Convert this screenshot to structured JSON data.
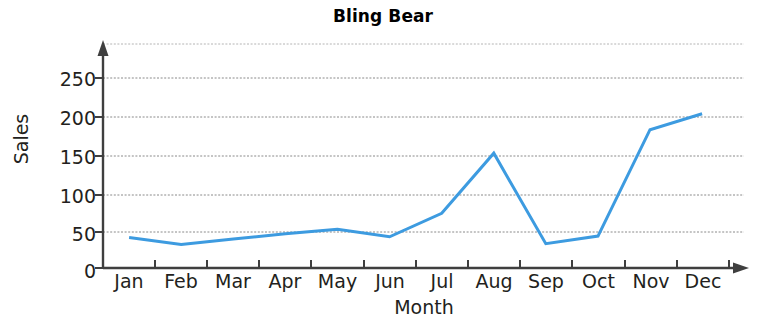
{
  "chart_data": {
    "type": "line",
    "title": "Bling Bear",
    "xlabel": "Month",
    "ylabel": "Sales",
    "categories": [
      "Jan",
      "Feb",
      "Mar",
      "Apr",
      "May",
      "Jun",
      "Jul",
      "Aug",
      "Sep",
      "Oct",
      "Nov",
      "Dec"
    ],
    "values": [
      40,
      31,
      38,
      45,
      51,
      41,
      72,
      151,
      32,
      42,
      182,
      203
    ],
    "series": [
      {
        "name": "Sales",
        "values": [
          40,
          31,
          38,
          45,
          51,
          41,
          72,
          151,
          32,
          42,
          182,
          203
        ]
      }
    ],
    "ylim": [
      0,
      275
    ],
    "yticks": [
      0,
      50,
      100,
      150,
      200,
      250
    ],
    "ytick_labels": [
      "0",
      "50",
      "100",
      "150",
      "200",
      "250"
    ],
    "grid": true,
    "grid_axis": "y",
    "legend": false,
    "line_color": "#3d9be0",
    "grid_color": "#808080",
    "axis_color": "#3f3f3f",
    "text_color": "#231f20",
    "markers": false,
    "line_width": 3
  }
}
